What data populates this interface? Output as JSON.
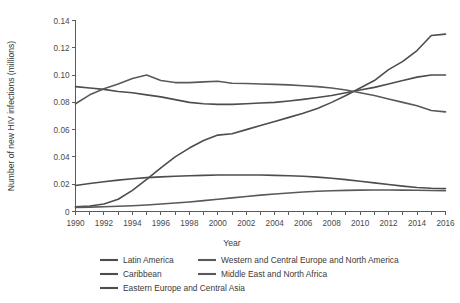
{
  "chart_data": {
    "type": "line",
    "title": "",
    "xlabel": "Year",
    "ylabel": "Number of new HIV infections (millions)",
    "xlim": [
      1990,
      2016
    ],
    "ylim": [
      0,
      0.14
    ],
    "grid": false,
    "legend_position": "bottom",
    "x": [
      1990,
      1991,
      1992,
      1993,
      1994,
      1995,
      1996,
      1997,
      1998,
      1999,
      2000,
      2001,
      2002,
      2003,
      2004,
      2005,
      2006,
      2007,
      2008,
      2009,
      2010,
      2011,
      2012,
      2013,
      2014,
      2015,
      2016
    ],
    "xticklabels": [
      "1990",
      "1992",
      "1994",
      "1996",
      "1998",
      "2000",
      "2002",
      "2004",
      "2006",
      "2008",
      "2010",
      "2012",
      "2014",
      "2016"
    ],
    "yticklabels": [
      "0",
      "0.02",
      "0.04",
      "0.06",
      "0.08",
      "0.10",
      "0.12",
      "0.14"
    ],
    "ytickvalues": [
      0,
      0.02,
      0.04,
      0.06,
      0.08,
      0.1,
      0.12,
      0.14
    ],
    "series": [
      {
        "name": "Latin America",
        "color": "#4d4d4d",
        "values": [
          0.0915,
          0.0905,
          0.0895,
          0.088,
          0.087,
          0.0855,
          0.084,
          0.082,
          0.08,
          0.079,
          0.0785,
          0.0785,
          0.079,
          0.0795,
          0.08,
          0.081,
          0.0822,
          0.0835,
          0.085,
          0.087,
          0.089,
          0.091,
          0.0935,
          0.096,
          0.0985,
          0.1,
          0.1
        ]
      },
      {
        "name": "Caribbean",
        "color": "#4d4d4d",
        "values": [
          0.019,
          0.0205,
          0.0218,
          0.023,
          0.024,
          0.0248,
          0.0254,
          0.0258,
          0.0262,
          0.0265,
          0.0268,
          0.0268,
          0.0268,
          0.0267,
          0.0265,
          0.0262,
          0.0258,
          0.0252,
          0.0244,
          0.0234,
          0.0222,
          0.021,
          0.0198,
          0.0186,
          0.0176,
          0.017,
          0.0168
        ]
      },
      {
        "name": "Eastern Europe and Central Asia",
        "color": "#4d4d4d",
        "values": [
          0.0035,
          0.004,
          0.0055,
          0.009,
          0.0155,
          0.0235,
          0.032,
          0.04,
          0.0465,
          0.052,
          0.056,
          0.057,
          0.06,
          0.063,
          0.066,
          0.069,
          0.072,
          0.0755,
          0.08,
          0.085,
          0.0905,
          0.096,
          0.104,
          0.11,
          0.118,
          0.129,
          0.13
        ]
      },
      {
        "name": "Western and Central Europe and North America",
        "color": "#595959",
        "values": [
          0.079,
          0.0855,
          0.09,
          0.0935,
          0.0975,
          0.1,
          0.096,
          0.0945,
          0.0945,
          0.095,
          0.0955,
          0.094,
          0.0938,
          0.0935,
          0.0932,
          0.0928,
          0.0922,
          0.0915,
          0.0905,
          0.089,
          0.087,
          0.085,
          0.0825,
          0.08,
          0.0775,
          0.074,
          0.073
        ]
      },
      {
        "name": "Middle East and North Africa",
        "color": "#595959",
        "values": [
          0.003,
          0.0032,
          0.0035,
          0.0038,
          0.0042,
          0.0048,
          0.0055,
          0.0062,
          0.007,
          0.008,
          0.009,
          0.01,
          0.011,
          0.012,
          0.0128,
          0.0136,
          0.0143,
          0.0148,
          0.0152,
          0.0155,
          0.0157,
          0.0158,
          0.0158,
          0.0157,
          0.0156,
          0.0154,
          0.0152
        ]
      }
    ],
    "legend": [
      {
        "label": "Latin America",
        "color": "#4d4d4d"
      },
      {
        "label": "Western and Central Europe and North America",
        "color": "#595959"
      },
      {
        "label": "Caribbean",
        "color": "#4d4d4d"
      },
      {
        "label": "Middle East and North Africa",
        "color": "#595959"
      },
      {
        "label": "Eastern Europe and Central Asia",
        "color": "#4d4d4d"
      }
    ]
  }
}
